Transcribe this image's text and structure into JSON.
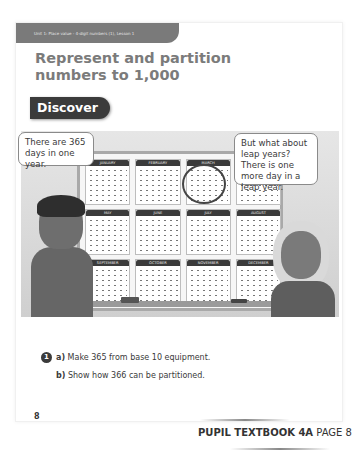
{
  "header": {
    "unit_label": "Unit 1: Place value - 4-digit numbers (1), Lesson 1",
    "title": "Represent and partition numbers to 1,000",
    "section_badge": "Discover"
  },
  "illustration": {
    "bubble_left": "There are 365 days in one year.",
    "bubble_right": "But what about leap years? There is one more day in a leap year.",
    "months": [
      "JANUARY",
      "FEBRUARY",
      "MARCH",
      "APRIL",
      "MAY",
      "JUNE",
      "JULY",
      "AUGUST",
      "SEPTEMBER",
      "OCTOBER",
      "NOVEMBER",
      "DECEMBER"
    ],
    "highlighted_month": "FEBRUARY"
  },
  "question": {
    "number": "1",
    "parts": [
      {
        "label": "a)",
        "text": "Make 365 from base 10 equipment."
      },
      {
        "label": "b)",
        "text": "Show how 366 can be partitioned."
      }
    ]
  },
  "footer": {
    "page_number": "8",
    "book_label": "PUPIL TEXTBOOK 4A",
    "page_label": "PAGE 8"
  }
}
